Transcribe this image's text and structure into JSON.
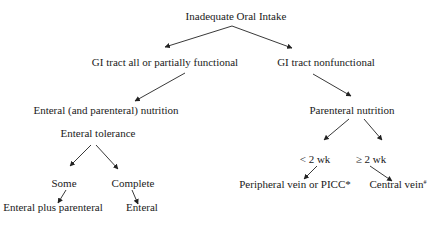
{
  "diagram": {
    "type": "flowchart",
    "title": "Inadequate Oral Intake",
    "nodes": [
      {
        "id": "root",
        "label": "Inadequate Oral Intake",
        "x": 236,
        "y": 10
      },
      {
        "id": "gi_functional",
        "label": "GI tract all or partially functional",
        "x": 165,
        "y": 56
      },
      {
        "id": "gi_nonfunctional",
        "label": "GI tract nonfunctional",
        "x": 326,
        "y": 56
      },
      {
        "id": "enteral_parenteral",
        "label": "Enteral (and parenteral) nutrition",
        "x": 106,
        "y": 104
      },
      {
        "id": "parenteral",
        "label": "Parenteral nutrition",
        "x": 352,
        "y": 104
      },
      {
        "id": "tolerance",
        "label": "Enteral tolerance",
        "x": 98,
        "y": 127
      },
      {
        "id": "lt2wk",
        "label": "< 2 wk",
        "x": 315,
        "y": 153
      },
      {
        "id": "ge2wk",
        "label": "≥ 2 wk",
        "x": 371,
        "y": 153
      },
      {
        "id": "some",
        "label": "Some",
        "x": 64,
        "y": 177
      },
      {
        "id": "complete",
        "label": "Complete",
        "x": 133,
        "y": 177
      },
      {
        "id": "peripheral",
        "label": "Peripheral vein or PICC*",
        "x": 295,
        "y": 178
      },
      {
        "id": "central",
        "label": "Central vein",
        "sup": "#",
        "x": 398,
        "y": 178
      },
      {
        "id": "enteral_plus",
        "label": "Enteral plus parenteral",
        "x": 53,
        "y": 201
      },
      {
        "id": "enteral",
        "label": "Enteral",
        "x": 142,
        "y": 201
      }
    ],
    "edges": [
      {
        "from": "root",
        "to": "gi_functional",
        "x1": 232,
        "y1": 26,
        "x2": 165,
        "y2": 47
      },
      {
        "from": "root",
        "to": "gi_nonfunctional",
        "x1": 232,
        "y1": 26,
        "x2": 292,
        "y2": 48
      },
      {
        "from": "gi_functional",
        "to": "enteral_parenteral",
        "x1": 185,
        "y1": 73,
        "x2": 135,
        "y2": 101
      },
      {
        "from": "gi_nonfunctional",
        "to": "parenteral",
        "x1": 313,
        "y1": 74,
        "x2": 351,
        "y2": 96
      },
      {
        "from": "parenteral",
        "to": "lt2wk",
        "x1": 349,
        "y1": 119,
        "x2": 324,
        "y2": 140
      },
      {
        "from": "parenteral",
        "to": "ge2wk",
        "x1": 364,
        "y1": 119,
        "x2": 382,
        "y2": 140
      },
      {
        "from": "tolerance",
        "to": "some",
        "x1": 91,
        "y1": 145,
        "x2": 70,
        "y2": 166
      },
      {
        "from": "tolerance",
        "to": "complete",
        "x1": 96,
        "y1": 145,
        "x2": 118,
        "y2": 169
      },
      {
        "from": "lt2wk",
        "to": "peripheral",
        "x1": 317,
        "y1": 166,
        "x2": 304,
        "y2": 179
      },
      {
        "from": "ge2wk",
        "to": "central",
        "x1": 370,
        "y1": 166,
        "x2": 392,
        "y2": 181
      },
      {
        "from": "some",
        "to": "enteral_plus",
        "x1": 66,
        "y1": 190,
        "x2": 58,
        "y2": 203
      },
      {
        "from": "complete",
        "to": "enteral",
        "x1": 132,
        "y1": 190,
        "x2": 138,
        "y2": 204
      }
    ]
  },
  "colors": {
    "background": "#ffffff",
    "text": "#1a1a1a",
    "line": "#222222"
  }
}
